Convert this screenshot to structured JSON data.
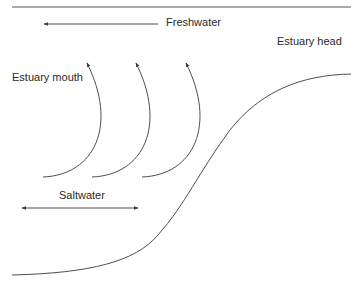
{
  "diagram": {
    "labels": {
      "freshwater": "Freshwater",
      "estuary_head": "Estuary head",
      "estuary_mouth": "Estuary mouth",
      "saltwater": "Saltwater"
    },
    "elements": {
      "surface_line": "water-surface-line",
      "freshwater_arrow": {
        "direction": "left"
      },
      "saltwater_arrow": {
        "direction": "both"
      },
      "circulation_arrows": [
        {
          "id": 1,
          "direction": "up"
        },
        {
          "id": 2,
          "direction": "up"
        },
        {
          "id": 3,
          "direction": "up"
        }
      ],
      "bed_profile": "estuary-bed-curve"
    },
    "colors": {
      "line": "#3a3a3a",
      "text": "#2a2a2a",
      "background": "#ffffff"
    }
  }
}
